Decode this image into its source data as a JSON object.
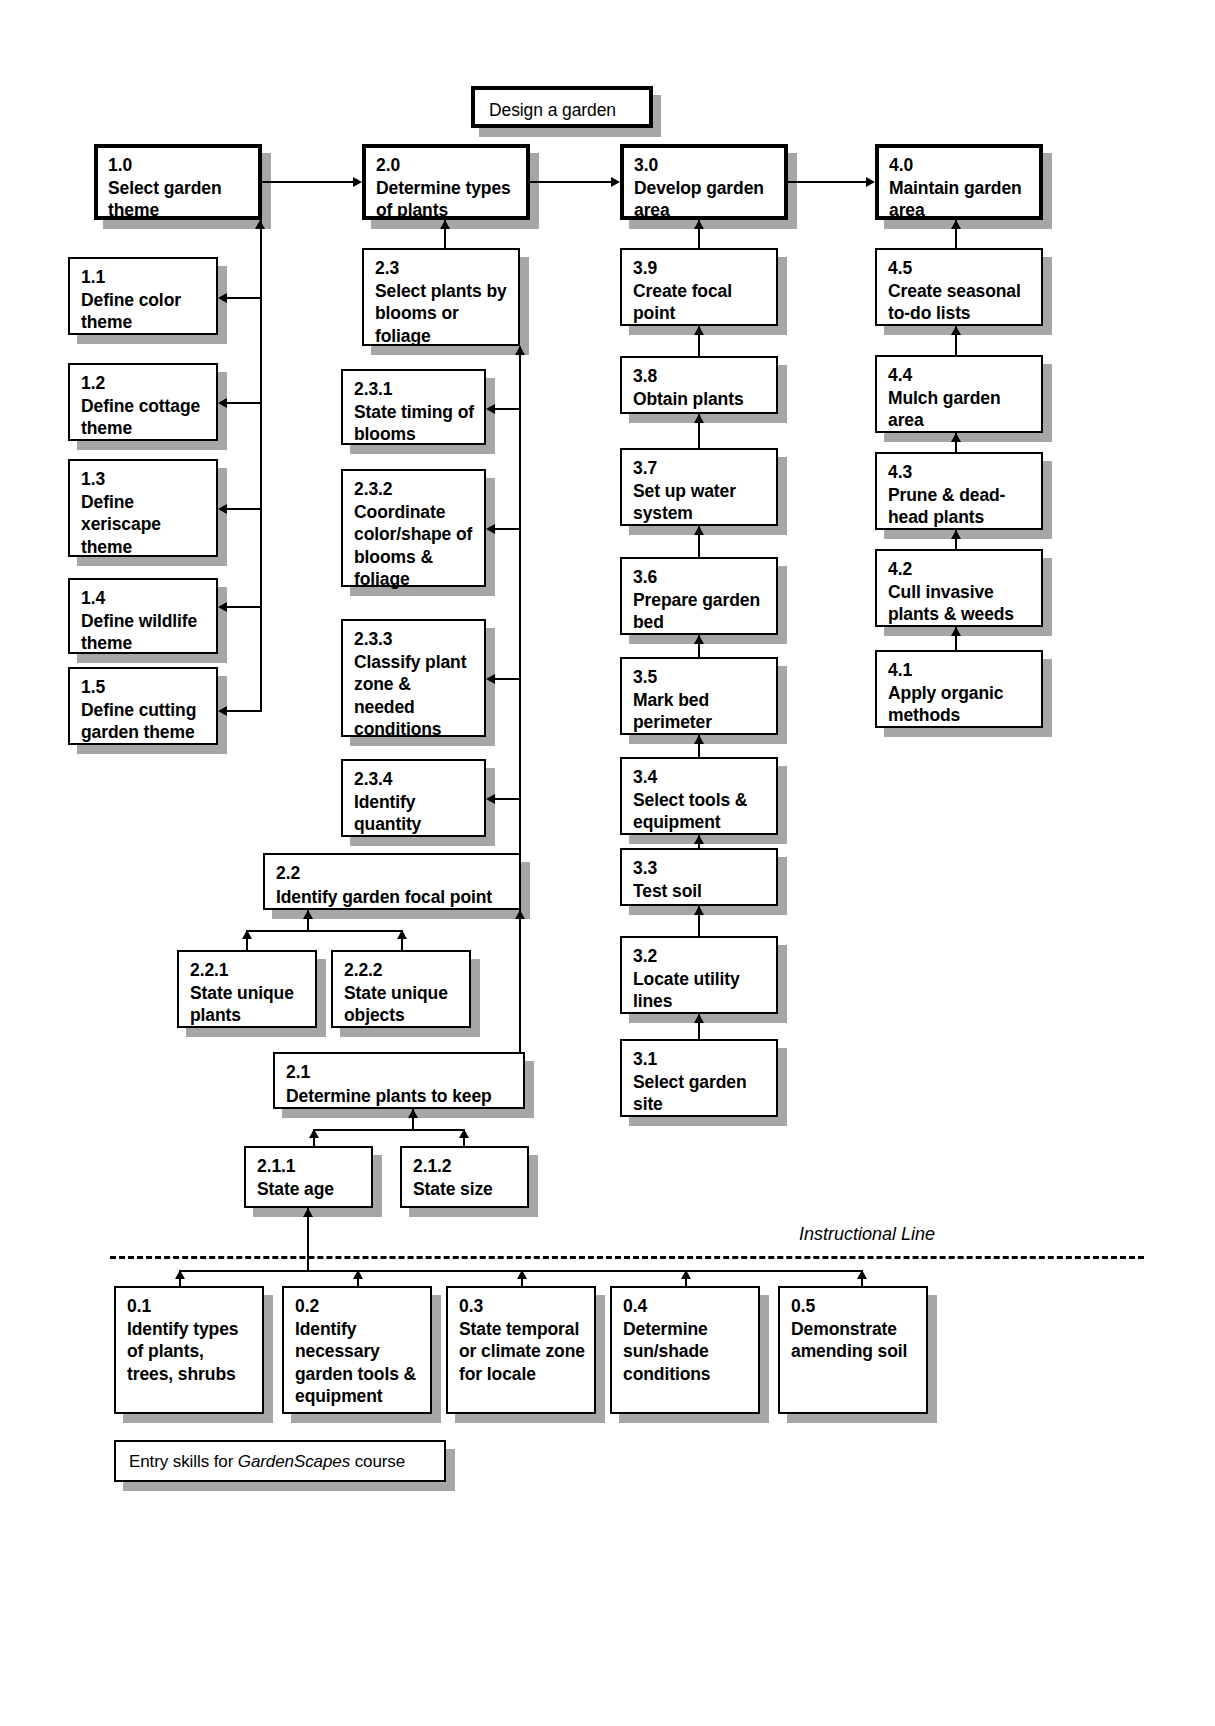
{
  "diagram": {
    "title": "Design a garden",
    "instructional_line_label": "Instructional Line",
    "entry_caption_prefix": "Entry skills for ",
    "entry_caption_italic": "GardenScapes",
    "entry_caption_suffix": " course",
    "colors": {
      "box_border": "#000000",
      "box_fill": "#ffffff",
      "shadow": "#a6a6a6",
      "connector": "#000000"
    }
  },
  "goal": {
    "num": "",
    "text": "Design a garden"
  },
  "main_steps": [
    {
      "num": "1.0",
      "text": "Select garden theme"
    },
    {
      "num": "2.0",
      "text": "Determine types of plants"
    },
    {
      "num": "3.0",
      "text": "Develop garden area"
    },
    {
      "num": "4.0",
      "text": "Maintain garden area"
    }
  ],
  "col1": [
    {
      "num": "1.1",
      "text": "Define color theme"
    },
    {
      "num": "1.2",
      "text": "Define cottage theme"
    },
    {
      "num": "1.3",
      "text": "Define xeriscape theme"
    },
    {
      "num": "1.4",
      "text": "Define wildlife theme"
    },
    {
      "num": "1.5",
      "text": "Define cutting garden theme"
    }
  ],
  "col2": {
    "s23": {
      "num": "2.3",
      "text": "Select plants by blooms or foliage"
    },
    "subs23": [
      {
        "num": "2.3.1",
        "text": "State timing of blooms"
      },
      {
        "num": "2.3.2",
        "text": "Coordinate color/shape of blooms & foliage"
      },
      {
        "num": "2.3.3",
        "text": "Classify plant zone & needed conditions"
      },
      {
        "num": "2.3.4",
        "text": "Identify quantity"
      }
    ],
    "s22": {
      "num": "2.2",
      "text": "Identify garden focal point"
    },
    "subs22": [
      {
        "num": "2.2.1",
        "text": "State unique plants"
      },
      {
        "num": "2.2.2",
        "text": "State unique objects"
      }
    ],
    "s21": {
      "num": "2.1",
      "text": "Determine plants to keep"
    },
    "subs21": [
      {
        "num": "2.1.1",
        "text": "State age"
      },
      {
        "num": "2.1.2",
        "text": "State size"
      }
    ]
  },
  "col3": [
    {
      "num": "3.9",
      "text": "Create focal point"
    },
    {
      "num": "3.8",
      "text": "Obtain plants"
    },
    {
      "num": "3.7",
      "text": "Set up water system"
    },
    {
      "num": "3.6",
      "text": "Prepare garden bed"
    },
    {
      "num": "3.5",
      "text": "Mark bed perimeter"
    },
    {
      "num": "3.4",
      "text": "Select tools & equipment"
    },
    {
      "num": "3.3",
      "text": "Test soil"
    },
    {
      "num": "3.2",
      "text": "Locate utility lines"
    },
    {
      "num": "3.1",
      "text": "Select garden site"
    }
  ],
  "col4": [
    {
      "num": "4.5",
      "text": "Create seasonal to-do lists"
    },
    {
      "num": "4.4",
      "text": "Mulch garden area"
    },
    {
      "num": "4.3",
      "text": "Prune & dead-head plants"
    },
    {
      "num": "4.2",
      "text": "Cull invasive plants & weeds"
    },
    {
      "num": "4.1",
      "text": "Apply organic methods"
    }
  ],
  "entry_skills": [
    {
      "num": "0.1",
      "text": "Identify types of plants, trees, shrubs"
    },
    {
      "num": "0.2",
      "text": "Identify necessary garden tools & equipment"
    },
    {
      "num": "0.3",
      "text": "State temporal or climate zone for locale"
    },
    {
      "num": "0.4",
      "text": "Determine sun/shade conditions"
    },
    {
      "num": "0.5",
      "text": "Demonstrate amending soil"
    }
  ]
}
